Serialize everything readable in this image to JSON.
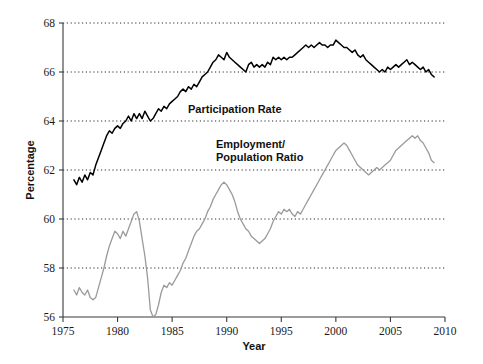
{
  "chart_data": {
    "type": "line",
    "title": "",
    "xlabel": "Year",
    "ylabel": "Percentage",
    "xlim": [
      1975,
      2010
    ],
    "ylim": [
      56,
      68
    ],
    "xticks": [
      1975,
      1980,
      1985,
      1990,
      1995,
      2000,
      2005,
      2010
    ],
    "xtick_labels": [
      "1975",
      "1980",
      "1985",
      "1990",
      "1995",
      "2000",
      "2005",
      "2010"
    ],
    "yticks": [
      56,
      58,
      60,
      62,
      64,
      66,
      68
    ],
    "ytick_labels": [
      "56",
      "58",
      "60",
      "62",
      "64",
      "66",
      "68"
    ],
    "grid": "horizontal-dotted",
    "legend_position": "inline-annotation",
    "colors": {
      "participation_rate": "#000000",
      "employment_population_ratio": "#9a9a9a",
      "axis": "#3a3a3a",
      "gridline": "#2b2b2b",
      "background": "#ffffff"
    },
    "annotations": [
      {
        "text": "Participation Rate",
        "x": 1986.2,
        "y": 64.55
      },
      {
        "text": "Employment/",
        "x": 1988.6,
        "y": 63.05
      },
      {
        "text": "Population Ratio",
        "x": 1988.6,
        "y": 62.55
      }
    ],
    "series": [
      {
        "name": "Participation Rate",
        "color": "#000000",
        "x": [
          1976.0,
          1976.25,
          1976.5,
          1976.75,
          1977.0,
          1977.25,
          1977.5,
          1977.75,
          1978.0,
          1978.25,
          1978.5,
          1978.75,
          1979.0,
          1979.25,
          1979.5,
          1979.75,
          1980.0,
          1980.25,
          1980.5,
          1980.75,
          1981.0,
          1981.25,
          1981.5,
          1981.75,
          1982.0,
          1982.25,
          1982.5,
          1982.75,
          1983.0,
          1983.25,
          1983.5,
          1983.75,
          1984.0,
          1984.25,
          1984.5,
          1984.75,
          1985.0,
          1985.25,
          1985.5,
          1985.75,
          1986.0,
          1986.25,
          1986.5,
          1986.75,
          1987.0,
          1987.25,
          1987.5,
          1987.75,
          1988.0,
          1988.25,
          1988.5,
          1988.75,
          1989.0,
          1989.25,
          1989.5,
          1989.75,
          1990.0,
          1990.25,
          1990.5,
          1990.75,
          1991.0,
          1991.25,
          1991.5,
          1991.75,
          1992.0,
          1992.25,
          1992.5,
          1992.75,
          1993.0,
          1993.25,
          1993.5,
          1993.75,
          1994.0,
          1994.25,
          1994.5,
          1994.75,
          1995.0,
          1995.25,
          1995.5,
          1995.75,
          1996.0,
          1996.25,
          1996.5,
          1996.75,
          1997.0,
          1997.25,
          1997.5,
          1997.75,
          1998.0,
          1998.25,
          1998.5,
          1998.75,
          1999.0,
          1999.25,
          1999.5,
          1999.75,
          2000.0,
          2000.25,
          2000.5,
          2000.75,
          2001.0,
          2001.25,
          2001.5,
          2001.75,
          2002.0,
          2002.25,
          2002.5,
          2002.75,
          2003.0,
          2003.25,
          2003.5,
          2003.75,
          2004.0,
          2004.25,
          2004.5,
          2004.75,
          2005.0,
          2005.25,
          2005.5,
          2005.75,
          2006.0,
          2006.25,
          2006.5,
          2006.75,
          2007.0,
          2007.25,
          2007.5,
          2007.75,
          2008.0,
          2008.25,
          2008.5,
          2008.75,
          2009.0
        ],
        "y": [
          61.6,
          61.4,
          61.7,
          61.5,
          61.8,
          61.6,
          61.9,
          61.8,
          62.2,
          62.5,
          62.8,
          63.1,
          63.4,
          63.6,
          63.5,
          63.7,
          63.8,
          63.7,
          63.9,
          64.0,
          64.2,
          64.0,
          64.3,
          64.1,
          64.3,
          64.1,
          64.4,
          64.2,
          64.0,
          64.1,
          64.3,
          64.5,
          64.4,
          64.6,
          64.5,
          64.7,
          64.8,
          64.9,
          65.0,
          65.2,
          65.3,
          65.2,
          65.4,
          65.3,
          65.5,
          65.4,
          65.6,
          65.8,
          65.9,
          66.0,
          66.2,
          66.4,
          66.5,
          66.7,
          66.6,
          66.5,
          66.8,
          66.6,
          66.5,
          66.4,
          66.3,
          66.2,
          66.1,
          66.0,
          66.3,
          66.4,
          66.2,
          66.3,
          66.2,
          66.3,
          66.2,
          66.4,
          66.3,
          66.6,
          66.5,
          66.6,
          66.5,
          66.6,
          66.5,
          66.6,
          66.6,
          66.7,
          66.8,
          66.9,
          67.0,
          67.1,
          67.0,
          67.1,
          67.0,
          67.1,
          67.2,
          67.1,
          67.1,
          67.0,
          67.1,
          67.1,
          67.3,
          67.2,
          67.1,
          67.0,
          67.0,
          66.9,
          66.8,
          66.9,
          66.7,
          66.6,
          66.7,
          66.5,
          66.4,
          66.3,
          66.2,
          66.1,
          66.0,
          66.1,
          66.0,
          66.2,
          66.1,
          66.2,
          66.3,
          66.2,
          66.3,
          66.4,
          66.5,
          66.3,
          66.4,
          66.3,
          66.2,
          66.1,
          66.2,
          66.0,
          66.1,
          65.9,
          65.8
        ]
      },
      {
        "name": "Employment/Population Ratio",
        "color": "#9a9a9a",
        "x": [
          1976.0,
          1976.25,
          1976.5,
          1976.75,
          1977.0,
          1977.25,
          1977.5,
          1977.75,
          1978.0,
          1978.25,
          1978.5,
          1978.75,
          1979.0,
          1979.25,
          1979.5,
          1979.75,
          1980.0,
          1980.25,
          1980.5,
          1980.75,
          1981.0,
          1981.25,
          1981.5,
          1981.75,
          1982.0,
          1982.25,
          1982.5,
          1982.75,
          1983.0,
          1983.25,
          1983.5,
          1983.75,
          1984.0,
          1984.25,
          1984.5,
          1984.75,
          1985.0,
          1985.25,
          1985.5,
          1985.75,
          1986.0,
          1986.25,
          1986.5,
          1986.75,
          1987.0,
          1987.25,
          1987.5,
          1987.75,
          1988.0,
          1988.25,
          1988.5,
          1988.75,
          1989.0,
          1989.25,
          1989.5,
          1989.75,
          1990.0,
          1990.25,
          1990.5,
          1990.75,
          1991.0,
          1991.25,
          1991.5,
          1991.75,
          1992.0,
          1992.25,
          1992.5,
          1992.75,
          1993.0,
          1993.25,
          1993.5,
          1993.75,
          1994.0,
          1994.25,
          1994.5,
          1994.75,
          1995.0,
          1995.25,
          1995.5,
          1995.75,
          1996.0,
          1996.25,
          1996.5,
          1996.75,
          1997.0,
          1997.25,
          1997.5,
          1997.75,
          1998.0,
          1998.25,
          1998.5,
          1998.75,
          1999.0,
          1999.25,
          1999.5,
          1999.75,
          2000.0,
          2000.25,
          2000.5,
          2000.75,
          2001.0,
          2001.25,
          2001.5,
          2001.75,
          2002.0,
          2002.25,
          2002.5,
          2002.75,
          2003.0,
          2003.25,
          2003.5,
          2003.75,
          2004.0,
          2004.25,
          2004.5,
          2004.75,
          2005.0,
          2005.25,
          2005.5,
          2005.75,
          2006.0,
          2006.25,
          2006.5,
          2006.75,
          2007.0,
          2007.25,
          2007.5,
          2007.75,
          2008.0,
          2008.25,
          2008.5,
          2008.75,
          2009.0
        ],
        "y": [
          57.1,
          56.9,
          57.2,
          57.0,
          56.9,
          57.1,
          56.8,
          56.7,
          56.8,
          57.2,
          57.6,
          58.0,
          58.5,
          58.9,
          59.2,
          59.5,
          59.4,
          59.2,
          59.5,
          59.3,
          59.6,
          59.9,
          60.2,
          60.3,
          59.9,
          59.2,
          58.5,
          57.6,
          56.3,
          56.0,
          56.1,
          56.5,
          57.0,
          57.3,
          57.2,
          57.4,
          57.3,
          57.5,
          57.7,
          57.9,
          58.2,
          58.4,
          58.7,
          59.0,
          59.3,
          59.5,
          59.6,
          59.8,
          60.0,
          60.3,
          60.5,
          60.8,
          61.0,
          61.2,
          61.4,
          61.5,
          61.4,
          61.2,
          61.0,
          60.7,
          60.3,
          60.0,
          59.8,
          59.6,
          59.5,
          59.3,
          59.2,
          59.1,
          59.0,
          59.1,
          59.2,
          59.4,
          59.6,
          59.9,
          60.1,
          60.3,
          60.2,
          60.4,
          60.3,
          60.4,
          60.2,
          60.1,
          60.3,
          60.2,
          60.4,
          60.6,
          60.8,
          61.0,
          61.2,
          61.4,
          61.6,
          61.8,
          62.0,
          62.2,
          62.4,
          62.6,
          62.8,
          62.9,
          63.0,
          63.1,
          63.0,
          62.8,
          62.6,
          62.4,
          62.2,
          62.1,
          62.0,
          61.9,
          61.8,
          61.9,
          62.0,
          62.1,
          62.0,
          62.1,
          62.2,
          62.3,
          62.4,
          62.6,
          62.8,
          62.9,
          63.0,
          63.1,
          63.2,
          63.3,
          63.4,
          63.3,
          63.4,
          63.2,
          63.1,
          62.9,
          62.7,
          62.4,
          62.3
        ]
      }
    ]
  },
  "labels": {
    "ylabel_text": "Percentage",
    "xlabel_text": "Year",
    "annot_participation": "Participation Rate",
    "annot_employment_line1": "Employment/",
    "annot_employment_line2": "Population Ratio"
  }
}
